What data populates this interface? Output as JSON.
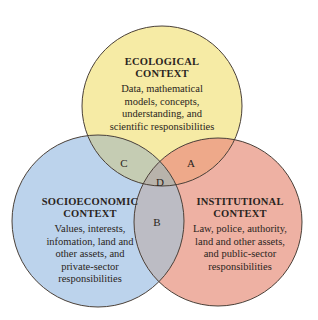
{
  "diagram": {
    "type": "venn",
    "circles": [
      {
        "id": "ecological",
        "title_line1": "ECOLOGICAL",
        "title_line2": "CONTEXT",
        "body_lines": [
          "Data, mathematical",
          "models, concepts,",
          "understanding, and",
          "scientific responsibilities"
        ],
        "color": "#f6ebA5"
      },
      {
        "id": "socioeconomic",
        "title_line1": "SOCIOECONOMIC",
        "title_line2": "CONTEXT",
        "body_lines": [
          "Values, interests,",
          "infomation, land and",
          "other assets, and",
          "private-sector",
          "responsibilities"
        ],
        "color": "#bcd3ec"
      },
      {
        "id": "institutional",
        "title_line1": "INSTITUTIONAL",
        "title_line2": "CONTEXT",
        "body_lines": [
          "Law, police, authority,",
          "land and other assets,",
          "and public-sector",
          "responsibilities"
        ],
        "color": "#eeb1a3"
      }
    ],
    "overlaps": {
      "A": {
        "label": "A",
        "between": [
          "ecological",
          "institutional"
        ],
        "color": "#eea98a"
      },
      "B": {
        "label": "B",
        "between": [
          "socioeconomic",
          "institutional"
        ],
        "color": "#bcbcc4"
      },
      "C": {
        "label": "C",
        "between": [
          "ecological",
          "socioeconomic"
        ],
        "color": "#c5ccb3"
      },
      "D": {
        "label": "D",
        "between": [
          "ecological",
          "socioeconomic",
          "institutional"
        ],
        "color": "#b8b3ab"
      }
    },
    "stroke_color": "#4a4038"
  }
}
